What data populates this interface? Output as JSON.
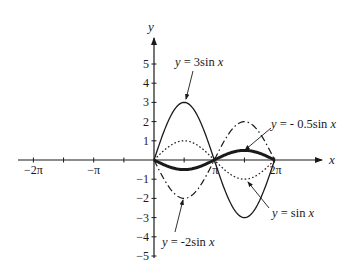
{
  "chart_data": {
    "type": "line",
    "title": "",
    "xlabel": "x",
    "ylabel": "y",
    "xlim": [
      -6.6,
      7.0
    ],
    "ylim": [
      -5.3,
      6.2
    ],
    "grid": false,
    "x_ticks": [
      {
        "value": -6.2832,
        "label": "−2π"
      },
      {
        "value": -4.7124,
        "label": ""
      },
      {
        "value": -3.1416,
        "label": "−π"
      },
      {
        "value": -1.5708,
        "label": ""
      },
      {
        "value": 1.5708,
        "label": ""
      },
      {
        "value": 3.1416,
        "label": "π"
      },
      {
        "value": 4.7124,
        "label": ""
      },
      {
        "value": 6.2832,
        "label": "2π"
      }
    ],
    "y_ticks": [
      {
        "value": 5,
        "label": "5"
      },
      {
        "value": 4,
        "label": "4"
      },
      {
        "value": 3,
        "label": "3"
      },
      {
        "value": 2,
        "label": "2"
      },
      {
        "value": 1,
        "label": "1"
      },
      {
        "value": -1,
        "label": "−1"
      },
      {
        "value": -2,
        "label": "−2"
      },
      {
        "value": -3,
        "label": "−3"
      },
      {
        "value": -4,
        "label": "−4"
      },
      {
        "value": -5,
        "label": "−5"
      }
    ],
    "domain": [
      0,
      6.2832
    ],
    "series": [
      {
        "name": "y = 3sin x",
        "amplitude": 3,
        "style": "solid-thin",
        "x": [
          0,
          1.5708,
          3.1416,
          4.7124,
          6.2832
        ],
        "values": [
          0,
          3,
          0,
          -3,
          0
        ]
      },
      {
        "name": "y = sin x",
        "amplitude": 1,
        "style": "dotted",
        "x": [
          0,
          1.5708,
          3.1416,
          4.7124,
          6.2832
        ],
        "values": [
          0,
          1,
          0,
          -1,
          0
        ]
      },
      {
        "name": "y = -2sin x",
        "amplitude": -2,
        "style": "dash-dot",
        "x": [
          0,
          1.5708,
          3.1416,
          4.7124,
          6.2832
        ],
        "values": [
          0,
          -2,
          0,
          2,
          0
        ]
      },
      {
        "name": "y = - 0.5sin x",
        "amplitude": -0.5,
        "style": "solid-thick",
        "x": [
          0,
          1.5708,
          3.1416,
          4.7124,
          6.2832
        ],
        "values": [
          0,
          -0.5,
          0,
          0.5,
          0
        ]
      }
    ],
    "annotations": [
      {
        "text": "y = 3sin x",
        "series": "y = 3sin x"
      },
      {
        "text": "y = - 0.5sin x",
        "series": "y = - 0.5sin x"
      },
      {
        "text": "y = -2sin x",
        "series": "y = -2sin x"
      },
      {
        "text": "y = sin x",
        "series": "y = sin x"
      }
    ],
    "legend": "none (arrow annotations)"
  },
  "labels": {
    "x_axis": "x",
    "y_axis": "y",
    "ann_3sin": {
      "pre": "y",
      "mid": " = 3sin ",
      "var": "x"
    },
    "ann_neg05sin": {
      "pre": "y",
      "mid": " = - 0.5sin ",
      "var": "x"
    },
    "ann_neg2sin": {
      "pre": "y",
      "mid": " = -2sin ",
      "var": "x"
    },
    "ann_sin": {
      "pre": "y",
      "mid": " = sin ",
      "var": "x"
    }
  },
  "colors": {
    "ink": "#1a1a1a",
    "background": "#ffffff"
  }
}
